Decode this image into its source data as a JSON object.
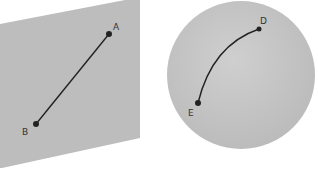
{
  "figure": {
    "panels": [
      {
        "shape": "plane",
        "fill": "#bdbdbd",
        "points": [
          {
            "label": "A",
            "x": 109,
            "y": 34
          },
          {
            "label": "B",
            "x": 36,
            "y": 124
          }
        ],
        "segment": "straight line A–B"
      },
      {
        "shape": "sphere",
        "fill": "#c4c4c4",
        "points": [
          {
            "label": "D",
            "x": 259,
            "y": 29
          },
          {
            "label": "E",
            "x": 198,
            "y": 103
          }
        ],
        "segment": "curved arc D–E"
      }
    ],
    "line_color": "#222222"
  }
}
